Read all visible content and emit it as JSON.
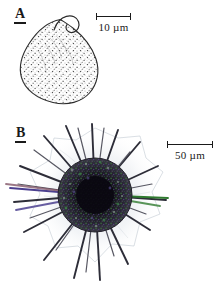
{
  "figure": {
    "background_color": "#ffffff",
    "width": 222,
    "height": 282,
    "ink_color": "#1a1a1a"
  },
  "panels": [
    {
      "id": "a",
      "label": "A",
      "subject": "stippled-test-organism",
      "description": "Ovoid stippled test with curled apical hook",
      "scalebar": {
        "value": "10",
        "unit": "µm",
        "caption": "10 µm",
        "length_px": 35
      }
    },
    {
      "id": "b",
      "label": "B",
      "subject": "spined-radiolarian-organism",
      "description": "Dark granular central capsule with radiating spines and faint surrounding halo",
      "scalebar": {
        "value": "50",
        "unit": "µm",
        "caption": "50 µm",
        "length_px": 46
      },
      "accent_colors": {
        "green_spine": "#2f7a2f",
        "purple_spine": "#4b3f8f",
        "capsule_dark": "#151218",
        "halo": "#d8dde4"
      }
    }
  ]
}
